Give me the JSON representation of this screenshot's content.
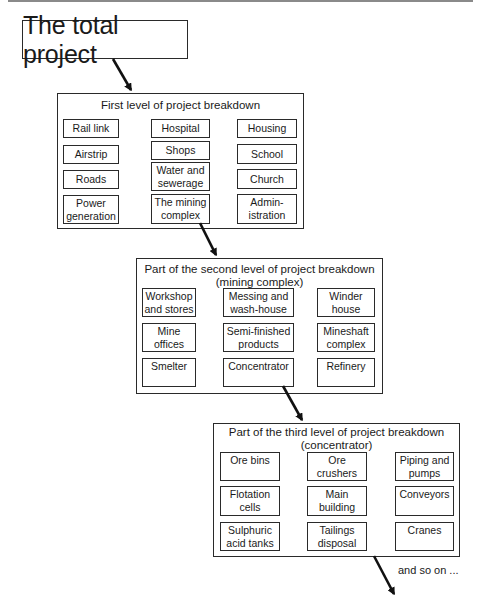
{
  "title": "The total project",
  "levels": [
    {
      "heading": "First level of project breakdown",
      "items": [
        {
          "label": "Rail link"
        },
        {
          "label": "Airstrip"
        },
        {
          "label": "Roads"
        },
        {
          "label": "Power\ngeneration"
        },
        {
          "label": "Hospital"
        },
        {
          "label": "Shops"
        },
        {
          "label": "Water and\nsewerage"
        },
        {
          "label": "The mining\ncomplex"
        },
        {
          "label": "Housing"
        },
        {
          "label": "School"
        },
        {
          "label": "Church"
        },
        {
          "label": "Admin-\nistration"
        }
      ]
    },
    {
      "heading": "Part of the second level of project breakdown\n(mining complex)",
      "items": [
        {
          "label": "Workshop\nand stores"
        },
        {
          "label": "Messing and\nwash-house"
        },
        {
          "label": "Winder\nhouse"
        },
        {
          "label": "Mine\noffices"
        },
        {
          "label": "Semi-finished\nproducts"
        },
        {
          "label": "Mineshaft\ncomplex"
        },
        {
          "label": "Smelter"
        },
        {
          "label": "Concentrator"
        },
        {
          "label": "Refinery"
        }
      ]
    },
    {
      "heading": "Part of the third level of project breakdown\n(concentrator)",
      "items": [
        {
          "label": "Ore bins"
        },
        {
          "label": "Ore\ncrushers"
        },
        {
          "label": "Piping and\npumps"
        },
        {
          "label": "Flotation\ncells"
        },
        {
          "label": "Main\nbuilding"
        },
        {
          "label": "Conveyors"
        },
        {
          "label": "Sulphuric\nacid tanks"
        },
        {
          "label": "Tailings\ndisposal"
        },
        {
          "label": "Cranes"
        }
      ]
    }
  ],
  "footer_note": "and so on ...",
  "colors": {
    "line": "#2a2a2a",
    "top_rule": "#8a8a8a",
    "background": "#ffffff"
  }
}
